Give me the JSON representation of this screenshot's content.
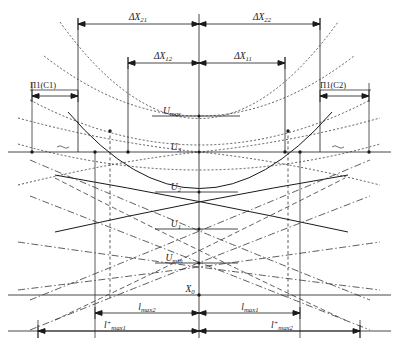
{
  "figure": {
    "type": "engineering-schematic",
    "title_visible": false,
    "background_color": "#ffffff",
    "line_color": "#1a1a1a",
    "width": 399,
    "height": 350
  },
  "dimension_labels": {
    "top_outer": [
      {
        "name": "delta-x-21",
        "base": "ΔX",
        "subscript": "21"
      },
      {
        "name": "delta-x-22",
        "base": "ΔX",
        "subscript": "22"
      }
    ],
    "top_inner": [
      {
        "name": "delta-x-12",
        "base": "ΔX",
        "subscript": "12"
      },
      {
        "name": "delta-x-11",
        "base": "ΔX",
        "subscript": "11"
      }
    ],
    "bottom_inner": [
      {
        "name": "l-max-2",
        "base": "l",
        "subscript": "max2",
        "superscript": ""
      },
      {
        "name": "l-max-1",
        "base": "l",
        "subscript": "max1",
        "superscript": ""
      }
    ],
    "bottom_outer": [
      {
        "name": "l-plus-max-1",
        "base": "l",
        "subscript": "max1",
        "superscript": "+"
      },
      {
        "name": "l-plus-max-2",
        "base": "l",
        "subscript": "max2",
        "superscript": "+"
      }
    ]
  },
  "side_labels": [
    {
      "name": "pi1-c1",
      "text": "П1(С1)"
    },
    {
      "name": "pi1-c2",
      "text": "П1(С2)"
    }
  ],
  "level_labels": [
    {
      "name": "u-max",
      "base": "U",
      "subscript": "max"
    },
    {
      "name": "u-3",
      "base": "U",
      "subscript": "3"
    },
    {
      "name": "u-2",
      "base": "U",
      "subscript": "2"
    },
    {
      "name": "u-1",
      "base": "U",
      "subscript": "1"
    },
    {
      "name": "u-min",
      "base": "U",
      "subscript": "min"
    }
  ],
  "axis_labels": [
    {
      "name": "x-zero",
      "base": "X",
      "subscript": "0"
    }
  ],
  "line_styles": {
    "solid": "solid",
    "dotted": "dotted",
    "dashed": "dashed",
    "dash_dot": "dash-dot"
  }
}
